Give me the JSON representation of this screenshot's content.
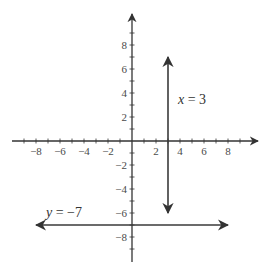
{
  "chart_data": {
    "type": "line",
    "title": "",
    "xlabel": "",
    "ylabel": "",
    "xlim": [
      -10,
      10
    ],
    "ylim": [
      -10,
      10
    ],
    "grid": false,
    "x_ticks": [
      -8,
      -6,
      -4,
      -2,
      2,
      4,
      6,
      8
    ],
    "x_tick_labels": [
      "−8",
      "−6",
      "−4",
      "−2",
      "2",
      "4",
      "6",
      "8"
    ],
    "y_ticks": [
      8,
      6,
      4,
      2,
      -2,
      -4,
      -6,
      -8
    ],
    "y_tick_labels": [
      "8",
      "6",
      "4",
      "2",
      "−2",
      "−4",
      "−6",
      "−8"
    ],
    "series": [
      {
        "name": "x = 3",
        "kind": "vertical-line",
        "x": 3,
        "y_range": [
          -6,
          7
        ],
        "arrows": "both",
        "label": "x = 3"
      },
      {
        "name": "y = −7",
        "kind": "horizontal-line",
        "y": -7,
        "x_range": [
          -8,
          8
        ],
        "arrows": "both",
        "label": "y = −7"
      }
    ],
    "colors": {
      "axis": "#333333",
      "line": "#3a3a3a",
      "text": "#4a4a4a"
    }
  }
}
